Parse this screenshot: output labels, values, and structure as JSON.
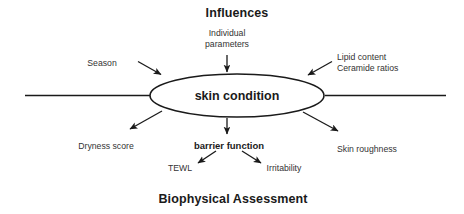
{
  "diagram": {
    "type": "cause-and-effect-fishbone",
    "title_top": "Influences",
    "title_bottom": "Biophysical Assessment",
    "center_node": "skin condition",
    "influences": [
      {
        "id": "season",
        "label": "Season"
      },
      {
        "id": "individual-parameters",
        "label": "Individual\nparameters"
      },
      {
        "id": "lipid-ceramide",
        "label": "Lipid content\nCeramide ratios"
      }
    ],
    "assessments": [
      {
        "id": "dryness-score",
        "label": "Dryness score"
      },
      {
        "id": "barrier-function",
        "label": "barrier function"
      },
      {
        "id": "skin-roughness",
        "label": "Skin roughness"
      }
    ],
    "barrier_function_children": [
      {
        "id": "tewl",
        "label": "TEWL"
      },
      {
        "id": "irritability",
        "label": "Irritability"
      }
    ],
    "colors": {
      "stroke": "#1a1a1a",
      "text": "#1a1a1a",
      "text_muted": "#333333",
      "background": "#ffffff"
    }
  }
}
